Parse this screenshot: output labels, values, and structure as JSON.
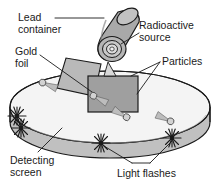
{
  "figure": {
    "background_color": "#ffffff",
    "line_color": "#1a1a1a",
    "text_color": "#1a1a1a"
  },
  "labels": {
    "lead_container": "Lead\ncontainer",
    "radioactive_source": "Radioactive\nsource",
    "gold_foil": "Gold\nfoil",
    "particles": "Particles",
    "detecting_screen": "Detecting\nscreen",
    "light_flashes": "Light flashes"
  },
  "parts": {
    "lead_container": {
      "name": "lead-container-cylinder",
      "fill": "#a8a8a8",
      "shade": "#8e8e8e"
    },
    "radioactive_source": {
      "name": "radioactive-source-aperture",
      "fill": "#c9c9c9",
      "rings": 3
    },
    "gold_foil": {
      "name": "gold-foil-sheet",
      "fill": "#b4b4b4"
    },
    "target_block": {
      "name": "target-block",
      "fill": "#9d9d9d"
    },
    "detecting_screen": {
      "name": "detecting-screen-ring",
      "top_fill": "#f2f2f2",
      "band_fill": "#bdbdbd"
    },
    "particles": {
      "name": "particle-markers",
      "count": 4,
      "fill": "#b0b0b0"
    },
    "light_flashes": {
      "name": "light-flash-starbursts",
      "count": 4
    }
  }
}
